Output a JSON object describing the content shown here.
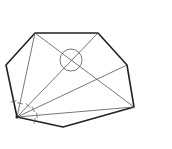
{
  "diagram": {
    "type": "heptagon-with-fan-diagonals",
    "vertices": {
      "A": [
        17,
        117
      ],
      "B": [
        6,
        65
      ],
      "C": [
        35,
        33
      ],
      "D": [
        98,
        33
      ],
      "E": [
        127,
        65
      ],
      "F": [
        134,
        107
      ],
      "G": [
        63,
        127
      ]
    },
    "outline_order": [
      "A",
      "B",
      "C",
      "D",
      "E",
      "F",
      "G"
    ],
    "diagonals_from_A": [
      "C",
      "D",
      "E",
      "F"
    ],
    "extra_diagonal": [
      "C",
      "F"
    ],
    "circle_mark": {
      "cx": 71,
      "cy": 60,
      "r": 11
    },
    "colors": {
      "outline": "#222222",
      "diagonal": "#555555",
      "background": "#ffffff"
    }
  }
}
